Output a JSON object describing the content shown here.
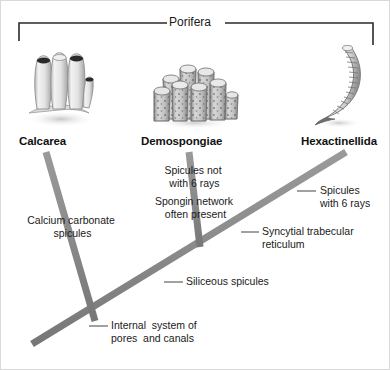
{
  "figure": {
    "type": "cladogram",
    "background_color": "#ffffff",
    "branch_color": "#8c8c8c",
    "bracket_color": "#2b2b2b",
    "leader_color": "#555555",
    "width": 390,
    "height": 370
  },
  "clade": {
    "label": "Porifera",
    "bracket": {
      "left_x": 18,
      "right_x": 372,
      "top_y": 22,
      "tick_height": 18
    }
  },
  "taxa": [
    {
      "id": "calcarea",
      "label": "Calcarea",
      "label_x": 18,
      "label_y": 134,
      "icon": "calcareous-sponge-icon",
      "icon_x": 16,
      "icon_y": 46,
      "icon_w": 84,
      "icon_h": 82
    },
    {
      "id": "demospongiae",
      "label": "Demospongiae",
      "label_x": 140,
      "label_y": 134,
      "icon": "demosponge-cluster-icon",
      "icon_x": 148,
      "icon_y": 56,
      "icon_w": 90,
      "icon_h": 72
    },
    {
      "id": "hexactinellida",
      "label": "Hexactinellida",
      "label_x": 300,
      "label_y": 134,
      "icon": "glass-sponge-icon",
      "icon_x": 312,
      "icon_y": 38,
      "icon_w": 62,
      "icon_h": 90
    }
  ],
  "branches": [
    {
      "id": "trunk",
      "name": "main-trunk",
      "x1": 31,
      "y1": 343,
      "x2": 345,
      "y2": 151,
      "width": 7
    },
    {
      "id": "calcarea-branch",
      "name": "calcarea-branch",
      "x1": 45,
      "y1": 151,
      "x2": 94,
      "y2": 320,
      "width": 7
    },
    {
      "id": "demospongiae-branch",
      "name": "demospongiae-branch",
      "x1": 188,
      "y1": 151,
      "x2": 199,
      "y2": 246,
      "width": 7
    }
  ],
  "annotations": [
    {
      "id": "spicules-not-6-rays",
      "name": "annotation-spicules-not-six-rays",
      "text": "Spicules not\n with 6 rays",
      "x": 148,
      "y": 163,
      "align": "center",
      "width": 88,
      "leader": null
    },
    {
      "id": "spongin-network",
      "name": "annotation-spongin-network",
      "text": "Spongin network\n often present",
      "x": 141,
      "y": 194,
      "align": "center",
      "width": 104,
      "leader": null
    },
    {
      "id": "spicules-6-rays",
      "name": "annotation-spicules-six-rays",
      "text": "Spicules\nwith 6 rays",
      "x": 319,
      "y": 183,
      "align": "left",
      "width": 68,
      "leader": {
        "x1": 296,
        "y1": 190,
        "x2": 315,
        "y2": 190
      }
    },
    {
      "id": "calcium-carbonate-spicules",
      "name": "annotation-calcium-carbonate-spicules",
      "text": "Calcium carbonate\n spicules",
      "x": 16,
      "y": 213,
      "align": "center",
      "width": 108,
      "leader": null
    },
    {
      "id": "syncytial-trabecular-reticulum",
      "name": "annotation-syncytial-trabecular-reticulum",
      "text": "Syncytial trabecular\nreticulum",
      "x": 261,
      "y": 224,
      "align": "left",
      "width": 108,
      "leader": {
        "x1": 240,
        "y1": 231,
        "x2": 258,
        "y2": 231
      }
    },
    {
      "id": "siliceous-spicules",
      "name": "annotation-siliceous-spicules",
      "text": "Siliceous spicules",
      "x": 185,
      "y": 274,
      "align": "left",
      "width": 96,
      "leader": {
        "x1": 163,
        "y1": 281,
        "x2": 182,
        "y2": 281
      }
    },
    {
      "id": "internal-system-pores-canals",
      "name": "annotation-internal-pores-canals",
      "text": "Internal  system of\npores  and canals",
      "x": 110,
      "y": 318,
      "align": "left",
      "width": 110,
      "leader": {
        "x1": 88,
        "y1": 325,
        "x2": 107,
        "y2": 325
      }
    }
  ]
}
